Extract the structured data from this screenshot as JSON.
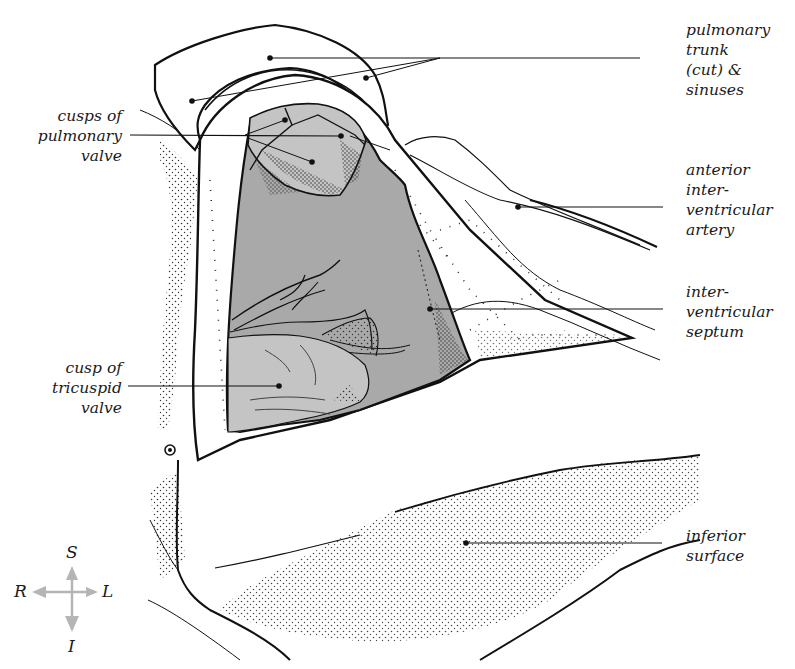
{
  "figure": {
    "colors": {
      "outline": "#111111",
      "ventricle_fill": "#a9a9a9",
      "cusp_fill": "#c4c4c4",
      "paper": "#ffffff",
      "compass": "#b5b5b5"
    }
  },
  "labels": {
    "pulmonary_trunk": "pulmonary\ntrunk\n(cut) &\nsinuses",
    "cusps_pulmonary_valve": "cusps of\npulmonary\nvalve",
    "anterior_interventricular_artery": "anterior\ninter-\nventricular\nartery",
    "interventricular_septum": "inter-\nventricular\nseptum",
    "cusp_tricuspid_valve": "cusp of\ntricuspid\nvalve",
    "inferior_surface": "inferior\nsurface"
  },
  "compass": {
    "superior": "S",
    "inferior": "I",
    "right": "R",
    "left": "L"
  }
}
